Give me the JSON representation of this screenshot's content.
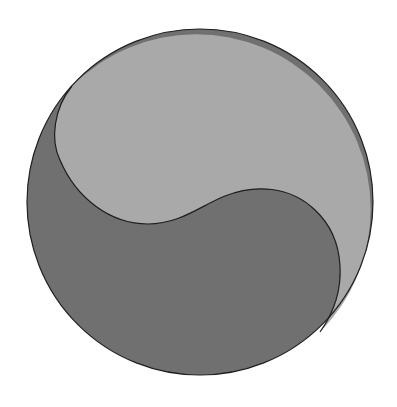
{
  "figure": {
    "colors": {
      "background": "#ffffff",
      "light_region": "#a9a9a9",
      "dark_region": "#707070",
      "outline": "#1e1e1e"
    }
  }
}
